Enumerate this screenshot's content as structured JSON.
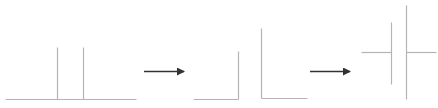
{
  "diagram": {
    "colors": {
      "line": "#b4b4b4",
      "arrow": "#333333",
      "background": "#ffffff"
    },
    "stages": [
      {
        "name": "stage-1-two-posts-on-baseline",
        "segments": [
          {
            "x1": 5,
            "y1": 99,
            "x2": 136,
            "y2": 99
          },
          {
            "x1": 57,
            "y1": 47,
            "x2": 57,
            "y2": 99
          },
          {
            "x1": 83,
            "y1": 47,
            "x2": 83,
            "y2": 99
          }
        ]
      },
      {
        "name": "stage-2-two-corners",
        "segments": [
          {
            "x1": 193,
            "y1": 99,
            "x2": 238,
            "y2": 99
          },
          {
            "x1": 238,
            "y1": 51,
            "x2": 238,
            "y2": 99
          },
          {
            "x1": 261,
            "y1": 28,
            "x2": 261,
            "y2": 98
          },
          {
            "x1": 261,
            "y1": 98,
            "x2": 307,
            "y2": 98
          }
        ]
      },
      {
        "name": "stage-3-capacitor-like-symbol",
        "segments": [
          {
            "x1": 361,
            "y1": 52,
            "x2": 391,
            "y2": 52
          },
          {
            "x1": 391,
            "y1": 22,
            "x2": 391,
            "y2": 84
          },
          {
            "x1": 406,
            "y1": 5,
            "x2": 406,
            "y2": 99
          },
          {
            "x1": 406,
            "y1": 52,
            "x2": 436,
            "y2": 52
          }
        ]
      }
    ],
    "arrows": [
      {
        "name": "arrow-1",
        "x1": 144,
        "y": 71,
        "x2": 184
      },
      {
        "name": "arrow-2",
        "x1": 310,
        "y": 71,
        "x2": 350
      }
    ]
  }
}
